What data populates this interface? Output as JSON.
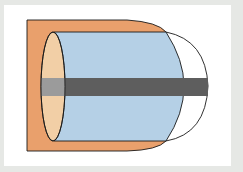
{
  "diagram": {
    "colors": {
      "background": "#e6e8e5",
      "panel": "#ffffff",
      "outer_shell": "#e9a06c",
      "inner_face": "#f2cfa6",
      "cylinder_body": "#b5d0e6",
      "dome": "#ffffff",
      "rod_inside": "#9b9b9b",
      "rod": "#5e5e5e",
      "outline": "#1a1a1a"
    },
    "components": [
      {
        "name": "outer-shell"
      },
      {
        "name": "cylinder-body"
      },
      {
        "name": "end-ellipse"
      },
      {
        "name": "dome-cap"
      },
      {
        "name": "central-rod"
      }
    ]
  }
}
